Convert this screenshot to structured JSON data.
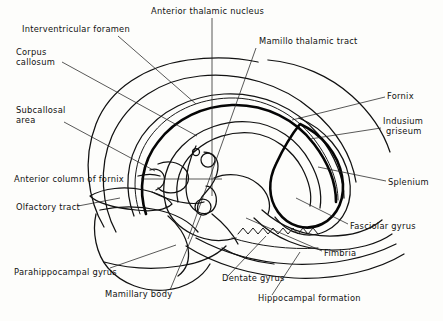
{
  "figure": {
    "type": "anatomical-line-diagram",
    "background_color": "#fdfdfb",
    "ink_color": "#111111",
    "width": 443,
    "height": 321
  },
  "labels": [
    {
      "id": "interventricular-foramen",
      "text": "Interventricular foramen",
      "x": 22,
      "y": 32,
      "anchor": "start"
    },
    {
      "id": "anterior-thalamic-nucleus",
      "text": "Anterior thalamic nucleus",
      "x": 151,
      "y": 14,
      "anchor": "start"
    },
    {
      "id": "mamillo-thalamic-tract",
      "text": "Mamillo thalamic tract",
      "x": 259,
      "y": 44,
      "anchor": "start"
    },
    {
      "id": "corpus-callosum-1",
      "text": "Corpus",
      "x": 16,
      "y": 55,
      "anchor": "start"
    },
    {
      "id": "corpus-callosum-2",
      "text": "callosum",
      "x": 16,
      "y": 65,
      "anchor": "start"
    },
    {
      "id": "fornix",
      "text": "Fornix",
      "x": 387,
      "y": 99,
      "anchor": "start"
    },
    {
      "id": "subcallosal-area-1",
      "text": "Subcallosal",
      "x": 16,
      "y": 113,
      "anchor": "start"
    },
    {
      "id": "subcallosal-area-2",
      "text": "area",
      "x": 16,
      "y": 123,
      "anchor": "start"
    },
    {
      "id": "indusium-griseum-1",
      "text": "Indusium",
      "x": 383,
      "y": 124,
      "anchor": "start"
    },
    {
      "id": "indusium-griseum-2",
      "text": "griseum",
      "x": 386,
      "y": 134,
      "anchor": "start"
    },
    {
      "id": "anterior-column-of-fornix",
      "text": "Anterior column of fornix",
      "x": 14,
      "y": 182,
      "anchor": "start"
    },
    {
      "id": "splenium",
      "text": "Splenium",
      "x": 388,
      "y": 185,
      "anchor": "start"
    },
    {
      "id": "olfactory-tract",
      "text": "Olfactory tract",
      "x": 16,
      "y": 210,
      "anchor": "start"
    },
    {
      "id": "fasciolar-gyrus",
      "text": "Fasciolar gyrus",
      "x": 350,
      "y": 229,
      "anchor": "start"
    },
    {
      "id": "fimbria",
      "text": "Fimbria",
      "x": 324,
      "y": 256,
      "anchor": "start"
    },
    {
      "id": "parahippocampal-gyrus",
      "text": "Parahippocampal gyrus",
      "x": 14,
      "y": 275,
      "anchor": "start"
    },
    {
      "id": "dentate-gyrus",
      "text": "Dentate gyrus",
      "x": 222,
      "y": 281,
      "anchor": "start"
    },
    {
      "id": "mamillary-body",
      "text": "Mamillary body",
      "x": 105,
      "y": 297,
      "anchor": "start"
    },
    {
      "id": "hippocampal-formation",
      "text": "Hippocampal formation",
      "x": 258,
      "y": 301,
      "anchor": "start"
    }
  ],
  "leader_lines": [
    {
      "id": "leader-interventricular-foramen",
      "path": "M 118 36 L 196 104"
    },
    {
      "id": "leader-anterior-thalamic-nucleus",
      "path": "M 212 18 L 212 196"
    },
    {
      "id": "leader-mamillo-thalamic-tract",
      "path": "M 256 48 L 188 239"
    },
    {
      "id": "leader-corpus-callosum",
      "path": "M 62 62 L 197 136"
    },
    {
      "id": "leader-fornix",
      "path": "M 385 97 L 292 120"
    },
    {
      "id": "leader-subcallosal-area",
      "path": "M 64 122 L 155 171"
    },
    {
      "id": "leader-indusium-griseum",
      "path": "M 381 128 L 310 139"
    },
    {
      "id": "leader-anterior-column-of-fornix",
      "path": "M 141 179 L 222 179"
    },
    {
      "id": "leader-splenium",
      "path": "M 386 181 L 318 167"
    },
    {
      "id": "leader-olfactory-tract",
      "path": "M 78 206 L 120 198"
    },
    {
      "id": "leader-fasciolar-gyrus",
      "path": "M 348 224 L 296 198"
    },
    {
      "id": "leader-fimbria",
      "path": "M 322 251 L 246 218"
    },
    {
      "id": "leader-parahippocampal-gyrus",
      "path": "M 110 268 L 176 245"
    },
    {
      "id": "leader-dentate-gyrus",
      "path": "M 228 276 L 266 236"
    },
    {
      "id": "leader-mamillary-body",
      "path": "M 170 290 L 202 213"
    },
    {
      "id": "leader-hippocampal-formation",
      "path": "M 272 295 L 300 252"
    }
  ],
  "structures": [
    {
      "id": "outer-cortical-outline",
      "name": "outer cortical outline"
    },
    {
      "id": "corpus-callosum-body",
      "name": "corpus callosum body"
    },
    {
      "id": "fornix-arch",
      "name": "fornix arch"
    },
    {
      "id": "splenium-ring",
      "name": "splenium ring"
    },
    {
      "id": "indusium-griseum-band",
      "name": "indusium griseum band"
    },
    {
      "id": "anterior-column-fornix",
      "name": "anterior column of fornix"
    },
    {
      "id": "mamillary-body-shape",
      "name": "mamillary body"
    },
    {
      "id": "dentate-gyrus-serration",
      "name": "dentate gyrus serrated margin"
    },
    {
      "id": "parahippocampal-gyrus-shape",
      "name": "parahippocampal gyrus"
    },
    {
      "id": "olfactory-tract-shape",
      "name": "olfactory tract"
    }
  ]
}
